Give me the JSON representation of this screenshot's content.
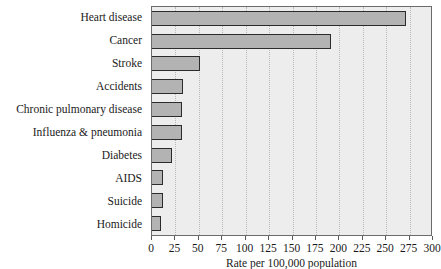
{
  "chart_data": {
    "type": "bar",
    "orientation": "horizontal",
    "title": "",
    "xlabel": "Rate per 100,000 population",
    "ylabel": "",
    "xlim": [
      0,
      300
    ],
    "xticks": [
      0,
      25,
      50,
      75,
      100,
      125,
      150,
      175,
      200,
      225,
      250,
      275,
      300
    ],
    "xtick_labels": [
      "0",
      "25",
      "50",
      "75",
      "100",
      "125",
      "150",
      "175",
      "200",
      "225",
      "250",
      "275",
      "300"
    ],
    "grid": true,
    "grid_axis": "x",
    "legend": null,
    "categories": [
      "Heart disease",
      "Cancer",
      "Stroke",
      "Accidents",
      "Chronic pulmonary disease",
      "Influenza & pneumonia",
      "Diabetes",
      "AIDS",
      "Suicide",
      "Homicide"
    ],
    "values": [
      271,
      191,
      51,
      33,
      32,
      32,
      21,
      12,
      12,
      10
    ],
    "colors": {
      "bar_fill": "#b3b3b3",
      "bar_edge": "#2b2b2b",
      "plot_background": "#ededed",
      "grid": "#b9b9b9",
      "axis": "#6b6b6b",
      "text": "#1a1a1a",
      "figure_background": "#ffffff"
    }
  }
}
